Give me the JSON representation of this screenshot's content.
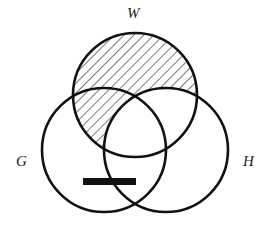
{
  "diagram": {
    "type": "venn-3-set",
    "sets": [
      {
        "name": "W",
        "cx": 135,
        "cy": 95,
        "r": 62
      },
      {
        "name": "G",
        "cx": 104,
        "cy": 150,
        "r": 62
      },
      {
        "name": "H",
        "cx": 166,
        "cy": 150,
        "r": 62
      }
    ],
    "labels": {
      "W": "W",
      "G": "G",
      "H": "H"
    },
    "shaded_region": "W outside H (hatched)",
    "bar_mark": "G and not W, straddling H boundary",
    "colors": {
      "stroke": "#111111",
      "hatch": "#222222",
      "background": "#ffffff"
    }
  }
}
